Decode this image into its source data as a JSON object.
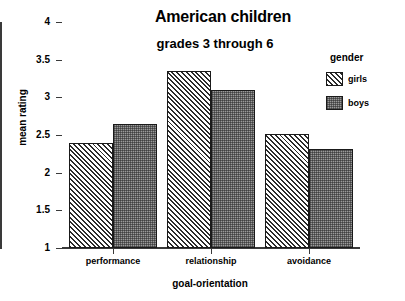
{
  "chart_data": {
    "type": "bar",
    "title": "American children",
    "subtitle": "grades 3 through 6",
    "xlabel": "goal-orientation",
    "ylabel": "mean rating",
    "categories": [
      "performance",
      "relationship",
      "avoidance"
    ],
    "series": [
      {
        "name": "girls",
        "values": [
          2.4,
          3.35,
          2.51
        ]
      },
      {
        "name": "boys",
        "values": [
          2.65,
          3.1,
          2.31
        ]
      }
    ],
    "legend_title": "gender",
    "legend_position": "right",
    "ylim": [
      1,
      4
    ],
    "yticks": [
      "1",
      "1.5",
      "2",
      "2.5",
      "3",
      "3.5",
      "4"
    ],
    "ytick_values": [
      1,
      1.5,
      2,
      2.5,
      3,
      3.5,
      4
    ],
    "grid": false,
    "colors": {
      "girls_fill": "#e8e8e8",
      "boys_fill": "#9a9a9a",
      "bar_outline": "#1a1a1a",
      "axis": "#3a3a3a",
      "background": "#ffffff",
      "text": "#000000"
    }
  }
}
